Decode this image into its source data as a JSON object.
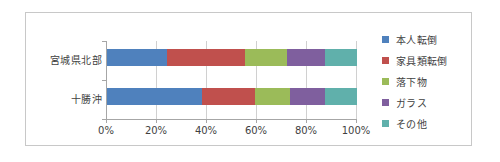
{
  "chart_data": {
    "type": "bar",
    "orientation": "horizontal",
    "stacked": "percent",
    "title": "",
    "xlabel": "",
    "ylabel": "",
    "categories": [
      "宮城県北部",
      "十勝沖"
    ],
    "series": [
      {
        "name": "本人転倒",
        "color": "#4f81bd",
        "values": [
          24,
          38
        ]
      },
      {
        "name": "家具類転倒",
        "color": "#c0504d",
        "values": [
          31,
          21
        ]
      },
      {
        "name": "落下物",
        "color": "#9bbb59",
        "values": [
          17,
          14
        ]
      },
      {
        "name": "ガラス",
        "color": "#7f5f9e",
        "values": [
          15,
          14
        ]
      },
      {
        "name": "その他",
        "color": "#60b0ab",
        "values": [
          13,
          13
        ]
      }
    ],
    "xlim": [
      0,
      100
    ],
    "xticks": [
      0,
      20,
      40,
      60,
      80,
      100
    ],
    "xtick_labels": [
      "0%",
      "20%",
      "40%",
      "60%",
      "80%",
      "100%"
    ],
    "grid": "vertical",
    "legend_position": "right"
  },
  "legend": {
    "items": [
      {
        "label": "本人転倒"
      },
      {
        "label": "家具類転倒"
      },
      {
        "label": "落下物"
      },
      {
        "label": "ガラス"
      },
      {
        "label": "その他"
      }
    ]
  },
  "colors": {
    "frame_border": "#c8c8c8",
    "axis": "#a6a6a6",
    "gridline": "#d0d0d0",
    "text": "#3f3f3f"
  }
}
